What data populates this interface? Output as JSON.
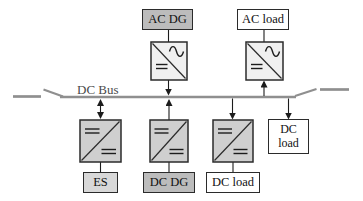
{
  "diagram": {
    "bus": {
      "label": "DC Bus"
    },
    "nodes": {
      "ac_dg": {
        "label": "AC DG"
      },
      "ac_load": {
        "label": "AC load"
      },
      "es": {
        "label": "ES"
      },
      "dc_dg": {
        "label": "DC DG"
      },
      "dc_load_bottom": {
        "label": "DC load"
      },
      "dc_load_right": {
        "line1": "DC",
        "line2": "load"
      }
    },
    "icons": {
      "ac_dc_converter": "square-with-diagonal-sine-wave-and-dc-bars",
      "dc_dc_converter": "square-with-diagonal-and-two-dc-bars",
      "bus_switch": "open-disconnect-blade",
      "arrow": "power-flow-arrow"
    },
    "colors": {
      "source_fill": "#bcbcbc",
      "load_fill": "#ffffff",
      "es_fill": "#d8d8d8",
      "converter_ac_fill": "#f0f0f0",
      "converter_dc_fill": "#cfcfcf",
      "bus_color": "#8f8f8f",
      "wire_color": "#1c1c1c",
      "border_color": "#2b2b2b",
      "bus_label_color": "#4a4a4a"
    }
  }
}
